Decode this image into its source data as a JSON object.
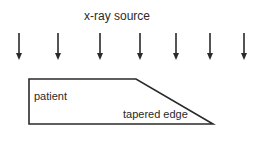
{
  "diagram": {
    "title": "x-ray source",
    "patient_label": "patient",
    "edge_label": "tapered edge",
    "arrows": {
      "count": 7,
      "x_positions": [
        19,
        58,
        100,
        140,
        176,
        210,
        244
      ],
      "y_start": 33,
      "y_end": 60,
      "direction": "down"
    },
    "shape": {
      "type": "trapezoid",
      "points": [
        [
          29,
          79
        ],
        [
          136,
          79
        ],
        [
          213,
          124
        ],
        [
          29,
          124
        ]
      ]
    },
    "colors": {
      "stroke": "#2a2a2a",
      "background": "#ffffff"
    }
  }
}
